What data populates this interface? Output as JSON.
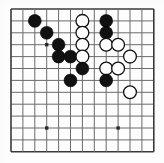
{
  "diagram": {
    "kind": "go-board-diagram",
    "board": {
      "columns": 13,
      "rows": 13,
      "origin_x": 11,
      "origin_y": 9,
      "spacing": 11.9,
      "line_color": "#6b6b6b",
      "edge_color": "#3a3a3a",
      "background_color": "#fdfdfd"
    },
    "star_points": [
      {
        "col": 3,
        "row": 3
      },
      {
        "col": 3,
        "row": 10
      },
      {
        "col": 9,
        "row": 10
      }
    ],
    "stone_colors": {
      "black": "#111111",
      "white": "#ffffff",
      "white_outline": "#111111"
    },
    "stone_radius": 6.4,
    "stones": [
      {
        "color": "black",
        "col": 2,
        "row": 1
      },
      {
        "color": "black",
        "col": 3,
        "row": 2
      },
      {
        "color": "white",
        "col": 6,
        "row": 1
      },
      {
        "color": "white",
        "col": 6,
        "row": 2
      },
      {
        "color": "black",
        "col": 8,
        "row": 1
      },
      {
        "color": "black",
        "col": 8,
        "row": 2
      },
      {
        "color": "black",
        "col": 4,
        "row": 3
      },
      {
        "color": "white",
        "col": 6,
        "row": 3
      },
      {
        "color": "white",
        "col": 8,
        "row": 3
      },
      {
        "color": "white",
        "col": 9,
        "row": 3
      },
      {
        "color": "black",
        "col": 4,
        "row": 4
      },
      {
        "color": "black",
        "col": 5,
        "row": 4
      },
      {
        "color": "white",
        "col": 6,
        "row": 4
      },
      {
        "color": "white",
        "col": 10,
        "row": 4
      },
      {
        "color": "black",
        "col": 6,
        "row": 5
      },
      {
        "color": "white",
        "col": 8,
        "row": 5
      },
      {
        "color": "white",
        "col": 9,
        "row": 5
      },
      {
        "color": "black",
        "col": 5,
        "row": 6
      },
      {
        "color": "black",
        "col": 8,
        "row": 6
      },
      {
        "color": "white",
        "col": 10,
        "row": 7
      }
    ]
  }
}
